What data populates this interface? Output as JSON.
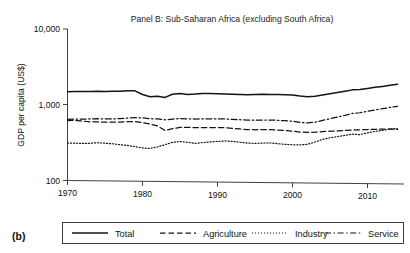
{
  "figure": {
    "letter": "(b)",
    "title": "Panel B: Sub-Saharan Africa (excluding South Africa)"
  },
  "axes": {
    "y_title": "GDP per capita (US$)",
    "y_ticks": [
      "10,000",
      "1,000",
      "100"
    ],
    "x_ticks": [
      "1970",
      "1980",
      "1990",
      "2000",
      "2010"
    ]
  },
  "legend": {
    "items": [
      {
        "label": "Total",
        "style": "solid"
      },
      {
        "label": "Agriculture",
        "style": "dashed"
      },
      {
        "label": "Industry",
        "style": "dotted"
      },
      {
        "label": "Service",
        "style": "dashdot"
      }
    ]
  },
  "chart_data": {
    "type": "line",
    "title": "Panel B: Sub-Saharan Africa (excluding South Africa)",
    "xlabel": "",
    "ylabel": "GDP per capita (US$)",
    "yscale": "log",
    "ylim": [
      100,
      10000
    ],
    "xlim": [
      1970,
      2014
    ],
    "grid": false,
    "legend_position": "bottom",
    "ytick_values": [
      100,
      1000,
      10000
    ],
    "xtick_values": [
      1970,
      1980,
      1990,
      2000,
      2010
    ],
    "x": [
      1970,
      1971,
      1972,
      1973,
      1974,
      1975,
      1976,
      1977,
      1978,
      1979,
      1980,
      1981,
      1982,
      1983,
      1984,
      1985,
      1986,
      1987,
      1988,
      1989,
      1990,
      1991,
      1992,
      1993,
      1994,
      1995,
      1996,
      1997,
      1998,
      1999,
      2000,
      2001,
      2002,
      2003,
      2004,
      2005,
      2006,
      2007,
      2008,
      2009,
      2010,
      2011,
      2012,
      2013,
      2014
    ],
    "series": [
      {
        "name": "Total",
        "style": "solid",
        "values": [
          1490,
          1495,
          1500,
          1510,
          1520,
          1515,
          1525,
          1530,
          1560,
          1560,
          1400,
          1310,
          1330,
          1290,
          1420,
          1460,
          1420,
          1440,
          1470,
          1470,
          1470,
          1460,
          1450,
          1445,
          1440,
          1450,
          1460,
          1460,
          1455,
          1450,
          1440,
          1400,
          1380,
          1400,
          1460,
          1520,
          1580,
          1650,
          1720,
          1740,
          1800,
          1870,
          1930,
          2000,
          2070
        ]
      },
      {
        "name": "Agriculture",
        "style": "dashed",
        "values": [
          618,
          622,
          612,
          600,
          600,
          596,
          596,
          600,
          608,
          612,
          596,
          570,
          540,
          472,
          500,
          520,
          522,
          518,
          522,
          520,
          524,
          524,
          514,
          506,
          498,
          496,
          500,
          500,
          494,
          490,
          480,
          470,
          466,
          470,
          478,
          486,
          492,
          500,
          508,
          512,
          518,
          522,
          528,
          530,
          524
        ]
      },
      {
        "name": "Industry",
        "style": "dotted",
        "values": [
          312,
          312,
          310,
          312,
          318,
          314,
          310,
          302,
          296,
          286,
          276,
          272,
          286,
          306,
          330,
          338,
          332,
          322,
          330,
          338,
          344,
          350,
          346,
          338,
          330,
          328,
          332,
          334,
          328,
          322,
          318,
          318,
          324,
          348,
          378,
          398,
          414,
          430,
          448,
          442,
          468,
          490,
          508,
          526,
          540
        ]
      },
      {
        "name": "Service",
        "style": "dashdot",
        "values": [
          640,
          648,
          650,
          654,
          660,
          658,
          660,
          666,
          680,
          690,
          686,
          672,
          668,
          652,
          668,
          682,
          678,
          674,
          678,
          680,
          682,
          682,
          676,
          670,
          664,
          664,
          668,
          670,
          666,
          660,
          650,
          630,
          622,
          636,
          672,
          710,
          750,
          790,
          840,
          860,
          900,
          940,
          980,
          1020,
          1060
        ]
      }
    ]
  }
}
